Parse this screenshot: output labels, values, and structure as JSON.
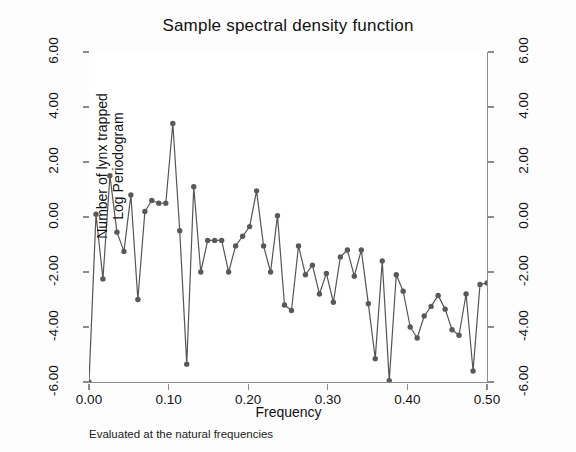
{
  "chart_data": {
    "type": "line",
    "title": "Sample spectral density function",
    "xlabel": "Frequency",
    "ylabel": "Number of lynx trapped\nLog Periodogram",
    "ylabel_line1": "Number of lynx trapped",
    "ylabel_line2": "Log Periodogram",
    "note": "Evaluated at the natural frequencies",
    "xlim": [
      0.0,
      0.5
    ],
    "ylim": [
      -6.0,
      6.0
    ],
    "xticks": [
      0.0,
      0.1,
      0.2,
      0.3,
      0.4,
      0.5
    ],
    "xticklabels": [
      "0.00",
      "0.10",
      "0.20",
      "0.30",
      "0.40",
      "0.50"
    ],
    "yticks": [
      6.0,
      4.0,
      2.0,
      0.0,
      -2.0,
      -4.0,
      -6.0
    ],
    "yticklabels": [
      "6.00",
      "4.00",
      "2.00",
      "0.00",
      "-2.00",
      "-4.00",
      "-6.00"
    ],
    "right_axis": true,
    "right_yticklabels": [
      "6.00",
      "4.00",
      "2.00",
      "0.00",
      "-2.00",
      "-4.00",
      "-6.00"
    ],
    "grid": false,
    "legend": null,
    "marker": "circle",
    "marker_color": "#595959",
    "line_color": "#555555",
    "series": [
      {
        "name": "Log Periodogram",
        "x": [
          0.0,
          0.0088,
          0.0175,
          0.0263,
          0.0351,
          0.0439,
          0.0526,
          0.0614,
          0.0702,
          0.0789,
          0.0877,
          0.0965,
          0.1053,
          0.114,
          0.1228,
          0.1316,
          0.1404,
          0.1491,
          0.1579,
          0.1667,
          0.1754,
          0.1842,
          0.193,
          0.2018,
          0.2105,
          0.2193,
          0.2281,
          0.2368,
          0.2456,
          0.2544,
          0.2632,
          0.2719,
          0.2807,
          0.2895,
          0.2982,
          0.307,
          0.3158,
          0.3246,
          0.3333,
          0.3421,
          0.3509,
          0.3596,
          0.3684,
          0.3772,
          0.386,
          0.3947,
          0.4035,
          0.4123,
          0.4211,
          0.4298,
          0.4386,
          0.4474,
          0.4561,
          0.4649,
          0.4737,
          0.4825,
          0.4912,
          0.5
        ],
        "y": [
          -6.0,
          0.1,
          -2.25,
          1.5,
          -0.55,
          -1.25,
          0.8,
          -3.0,
          0.2,
          0.6,
          0.5,
          0.5,
          3.4,
          -0.5,
          -5.35,
          1.1,
          -2.0,
          -0.85,
          -0.85,
          -0.85,
          -2.0,
          -1.05,
          -0.7,
          -0.35,
          0.95,
          -1.05,
          -2.0,
          0.05,
          -3.2,
          -3.4,
          -1.05,
          -2.1,
          -1.75,
          -2.8,
          -2.05,
          -3.1,
          -1.45,
          -1.2,
          -2.15,
          -1.2,
          -3.15,
          -5.15,
          -1.6,
          -5.95,
          -2.1,
          -2.7,
          -4.0,
          -4.4,
          -3.6,
          -3.25,
          -2.85,
          -3.35,
          -4.1,
          -4.3,
          -2.8,
          -5.6,
          -2.45,
          -2.4
        ]
      }
    ]
  },
  "axes": {
    "y_title_line1": "Number of lynx trapped",
    "y_title_line2": "Log Periodogram",
    "x_title": "Frequency"
  },
  "footnote": {
    "text": "Evaluated at the natural frequencies"
  },
  "colors": {
    "background": "#fdfdfd",
    "plot_background": "#ffffff",
    "axis": "#8b8b8b",
    "line": "#555555",
    "marker": "#595959",
    "text": "#111111"
  }
}
